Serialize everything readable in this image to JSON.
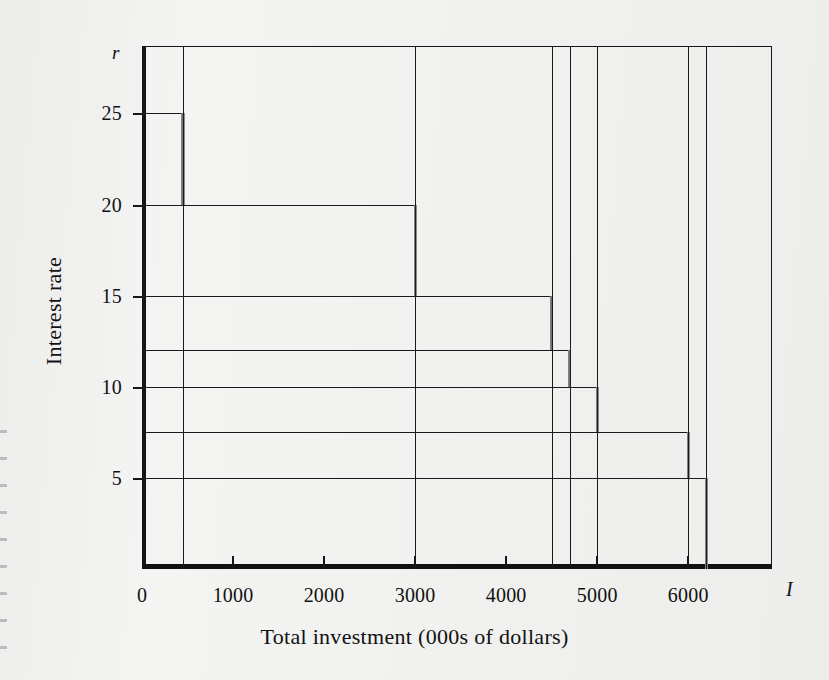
{
  "chart_data": {
    "type": "line",
    "title": "",
    "subtitle": "",
    "xlabel": "Total investment (000s of dollars)",
    "ylabel": "Interest rate",
    "x_axis_symbol": "I",
    "y_axis_symbol": "r",
    "xlim": [
      0,
      6920
    ],
    "ylim": [
      0,
      28.7
    ],
    "grid": false,
    "legend": null,
    "style": "step-descending",
    "x_ticks": [
      {
        "value": 0,
        "label": "0"
      },
      {
        "value": 1000,
        "label": "1000"
      },
      {
        "value": 2000,
        "label": "2000"
      },
      {
        "value": 3000,
        "label": "3000"
      },
      {
        "value": 4000,
        "label": "4000"
      },
      {
        "value": 5000,
        "label": "5000"
      },
      {
        "value": 6000,
        "label": "6000"
      }
    ],
    "y_ticks": [
      {
        "value": 5,
        "label": "5"
      },
      {
        "value": 10,
        "label": "10"
      },
      {
        "value": 15,
        "label": "15"
      },
      {
        "value": 20,
        "label": "20"
      },
      {
        "value": 25,
        "label": "25"
      }
    ],
    "y_gridline_values": [
      5,
      7.5,
      10,
      12,
      15,
      20,
      25
    ],
    "steps": [
      {
        "rate": 25,
        "cumulative_investment_start": 0,
        "cumulative_investment_end": 450
      },
      {
        "rate": 20,
        "cumulative_investment_start": 0,
        "cumulative_investment_end": 3000
      },
      {
        "rate": 15,
        "cumulative_investment_start": 0,
        "cumulative_investment_end": 4500
      },
      {
        "rate": 12,
        "cumulative_investment_start": 0,
        "cumulative_investment_end": 4700
      },
      {
        "rate": 10,
        "cumulative_investment_start": 0,
        "cumulative_investment_end": 5000
      },
      {
        "rate": 7.5,
        "cumulative_investment_start": 0,
        "cumulative_investment_end": 6000
      },
      {
        "rate": 5,
        "cumulative_investment_start": 0,
        "cumulative_investment_end": 6200
      }
    ],
    "vertical_drop_lines_at": [
      450,
      3000,
      4500,
      4700,
      5000,
      6000,
      6200
    ],
    "colors": {
      "axis": "#161616",
      "step_line": "#1b1b1b",
      "riser": "#777777",
      "background": "#f2f2f0"
    }
  }
}
